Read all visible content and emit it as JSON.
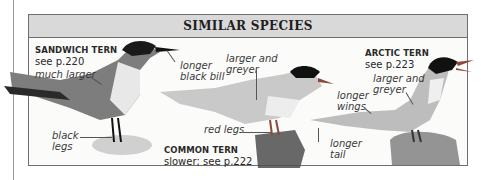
{
  "box": {
    "title": "SIMILAR SPECIES",
    "header_color": "#d9d9d9",
    "border_color": "#6e6e6e"
  },
  "species": [
    {
      "name": "SANDWICH TERN",
      "ref": "see p.220",
      "annotations": [
        "much larger",
        "longer",
        "black bill",
        "black",
        "legs"
      ]
    },
    {
      "name": "COMMON TERN",
      "ref": "slower; see p.222",
      "annotations": [
        "larger and",
        "greyer",
        "red legs"
      ]
    },
    {
      "name": "ARCTIC TERN",
      "ref": "see p.223",
      "annotations": [
        "larger and",
        "greyer",
        "longer",
        "wings",
        "longer",
        "tail"
      ]
    }
  ]
}
